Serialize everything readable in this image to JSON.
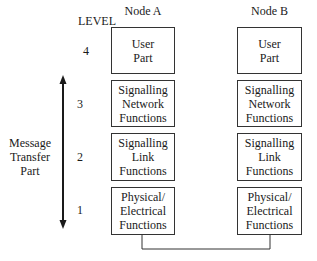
{
  "diagram": {
    "level_header": "LEVEL",
    "node_a_label": "Node A",
    "node_b_label": "Node B",
    "side_label": [
      "Message",
      "Transfer",
      "Part"
    ],
    "levels": [
      {
        "number": "4",
        "lines": [
          "User",
          "Part"
        ]
      },
      {
        "number": "3",
        "lines": [
          "Signalling",
          "Network",
          "Functions"
        ]
      },
      {
        "number": "2",
        "lines": [
          "Signalling",
          "Link",
          "Functions"
        ]
      },
      {
        "number": "1",
        "lines": [
          "Physical/",
          "Electrical",
          "Functions"
        ]
      }
    ],
    "arrow": {
      "type": "double-headed",
      "spans_levels": [
        "1",
        "3"
      ]
    },
    "connector": {
      "from": "Node A Physical/Electrical Functions",
      "to": "Node B Physical/Electrical Functions"
    },
    "colors": {
      "line": "#333333",
      "text": "#1a1a1a",
      "background": "#ffffff"
    }
  }
}
